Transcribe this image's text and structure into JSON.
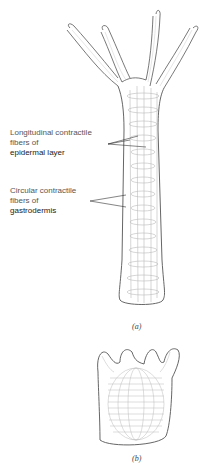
{
  "figure": {
    "part_a": {
      "caption": "(a)",
      "labels": [
        {
          "line1": "Longitudinal contractile",
          "line2": "fibers of",
          "line3": "epidermal layer"
        },
        {
          "line1": "Circular contractile",
          "line2": "fibers of",
          "line3": "gastrodermis"
        }
      ]
    },
    "part_b": {
      "caption": "(b)"
    },
    "colors": {
      "outline": "#555555",
      "fibers": "#bbbbbb",
      "text": "#444444"
    }
  }
}
